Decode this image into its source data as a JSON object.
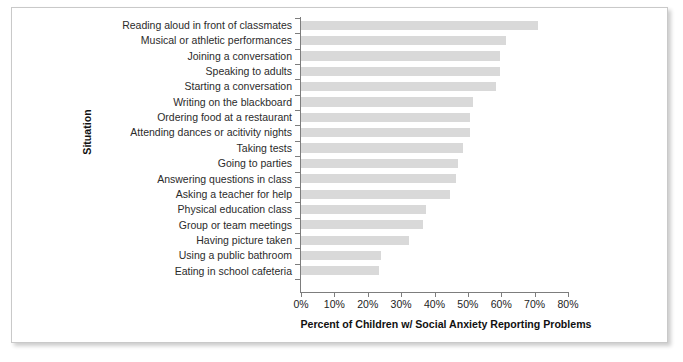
{
  "chart_data": {
    "type": "bar",
    "orientation": "horizontal",
    "title": "",
    "xlabel": "Percent of Children w/ Social Anxiety Reporting Problems",
    "ylabel": "Situation",
    "xlim": [
      0,
      80
    ],
    "grid": false,
    "legend": null,
    "bar_color": "#d9d9d9",
    "xticks": [
      "0%",
      "10%",
      "20%",
      "30%",
      "40%",
      "50%",
      "60%",
      "70%",
      "80%"
    ],
    "xtick_values": [
      0,
      10,
      20,
      30,
      40,
      50,
      60,
      70,
      80
    ],
    "categories": [
      "Reading aloud in front of classmates",
      "Musical or athletic performances",
      "Joining a conversation",
      "Speaking to adults",
      "Starting a conversation",
      "Writing on the blackboard",
      "Ordering food at a restaurant",
      "Attending dances or acitivity nights",
      "Taking tests",
      "Going to parties",
      "Answering questions in class",
      "Asking a teacher for help",
      "Physical education class",
      "Group or team meetings",
      "Having picture taken",
      "Using a public bathroom",
      "Eating in school cafeteria"
    ],
    "values": [
      71,
      61.5,
      59.5,
      59.5,
      58.5,
      51.5,
      50.5,
      50.5,
      48.5,
      47,
      46.5,
      44.5,
      37.5,
      36.5,
      32.5,
      24,
      23.5
    ]
  }
}
